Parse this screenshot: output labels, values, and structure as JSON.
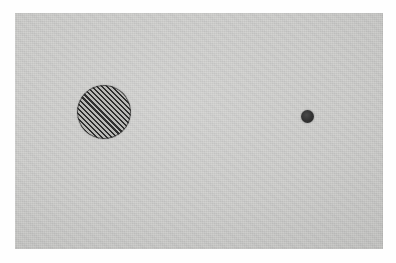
{
  "figure": {
    "medium": "scanned photographic print",
    "caption": "",
    "page_background_color": "#fefefe",
    "plate": {
      "background_color": "#c9c9c7",
      "x": 15,
      "y": 13,
      "width": 368,
      "height": 236
    },
    "objects": [
      {
        "name": "hatched-circle",
        "shape": "circle",
        "fill": "diagonal-hatch",
        "hatch_angle_degrees": 45,
        "hatch_spacing_px": 3.6,
        "line_color": "#2e2e2e",
        "outline_color": "#343434",
        "center_x": 104,
        "center_y": 112,
        "diameter_px": 54,
        "label": ""
      },
      {
        "name": "solid-dot",
        "shape": "circle",
        "fill": "solid",
        "fill_color": "#333333",
        "center_x": 307,
        "center_y": 116,
        "diameter_px": 13,
        "label": ""
      }
    ],
    "annotations": [],
    "axis_labels": [],
    "legend": []
  }
}
